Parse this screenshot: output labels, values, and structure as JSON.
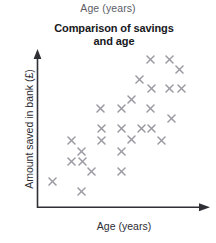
{
  "top_caption": "Age (years)",
  "title_lines": [
    "Comparison of savings",
    "and age"
  ],
  "axis": {
    "x_label": "Age (years)",
    "y_label": "Amount saved in bank (£)",
    "x_arrow": "arrow-right",
    "y_arrow": "arrow-up"
  },
  "colors": {
    "marker": "#9a9aa2",
    "axis": "#2f2f36",
    "title": "#17171c",
    "label": "#2d2d34",
    "caption": "#5d5d66",
    "background": "#ffffff"
  },
  "chart_data": {
    "type": "scatter",
    "xlabel": "Age (years)",
    "ylabel": "Amount saved in bank (£)",
    "xlim": [
      0,
      100
    ],
    "ylim": [
      0,
      100
    ],
    "grid": false,
    "legend": null,
    "marker": "x",
    "marker_color": "#9a9aa2",
    "n_points": 28,
    "points_px": [
      [
        150,
        59
      ],
      [
        169,
        59
      ],
      [
        179,
        69
      ],
      [
        139,
        79
      ],
      [
        151,
        88
      ],
      [
        169,
        88
      ],
      [
        181,
        88
      ],
      [
        131,
        99
      ],
      [
        100,
        108
      ],
      [
        121,
        108
      ],
      [
        150,
        108
      ],
      [
        171,
        118
      ],
      [
        101,
        128
      ],
      [
        121,
        128
      ],
      [
        141,
        128
      ],
      [
        151,
        128
      ],
      [
        71,
        140
      ],
      [
        101,
        140
      ],
      [
        131,
        139
      ],
      [
        161,
        140
      ],
      [
        81,
        151
      ],
      [
        121,
        151
      ],
      [
        71,
        161
      ],
      [
        82,
        161
      ],
      [
        91,
        171
      ],
      [
        121,
        171
      ],
      [
        52,
        181
      ],
      [
        81,
        191
      ]
    ],
    "points": [
      [
        63,
        91
      ],
      [
        75,
        91
      ],
      [
        81,
        85
      ],
      [
        56,
        79
      ],
      [
        64,
        73
      ],
      [
        75,
        73
      ],
      [
        83,
        73
      ],
      [
        52,
        66
      ],
      [
        37,
        60
      ],
      [
        50,
        60
      ],
      [
        63,
        60
      ],
      [
        76,
        54
      ],
      [
        38,
        46
      ],
      [
        50,
        46
      ],
      [
        57,
        46
      ],
      [
        64,
        46
      ],
      [
        19,
        39
      ],
      [
        38,
        39
      ],
      [
        52,
        40
      ],
      [
        70,
        39
      ],
      [
        25,
        32
      ],
      [
        50,
        32
      ],
      [
        19,
        26
      ],
      [
        25,
        26
      ],
      [
        30,
        20
      ],
      [
        50,
        20
      ],
      [
        9,
        14
      ],
      [
        25,
        7
      ]
    ]
  }
}
